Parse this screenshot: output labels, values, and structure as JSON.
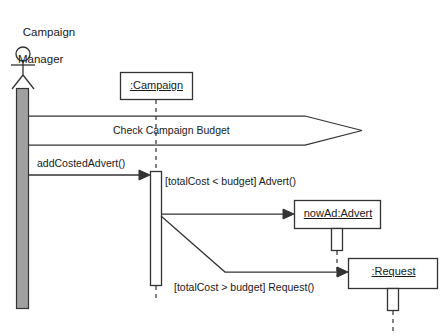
{
  "diagram": {
    "type": "uml-sequence-diagram",
    "width": 442,
    "height": 336,
    "background": "#ffffff",
    "line_color": "#333333",
    "text_color": "#1a1a1a",
    "activation_fill_actor": "#a0a0a0",
    "activation_fill_object": "#ffffff"
  },
  "actor": {
    "name_line1": "Campaign",
    "name_line2": "Manager",
    "icon": "stick-figure-actor-icon"
  },
  "lifelines": [
    {
      "id": "campaign",
      "label": ":Campaign",
      "underlined": true
    },
    {
      "id": "advert",
      "label": "nowAd:Advert",
      "underlined": true
    },
    {
      "id": "request",
      "label": ":Request",
      "underlined": true
    }
  ],
  "messages": [
    {
      "id": "check-campaign-budget",
      "label": "Check Campaign Budget",
      "shape": "wide-block-arrow",
      "from": "actor",
      "to": "right"
    },
    {
      "id": "add-costed-advert",
      "label": "addCostedAdvert()",
      "shape": "arrow",
      "from": "actor",
      "to": "campaign"
    },
    {
      "id": "advert-create",
      "label": "[totalCost < budget] Advert()",
      "shape": "arrow",
      "from": "campaign",
      "to": "advert"
    },
    {
      "id": "request-create",
      "label": "[totalCost > budget] Request()",
      "shape": "arrow",
      "from": "campaign",
      "to": "request"
    }
  ]
}
